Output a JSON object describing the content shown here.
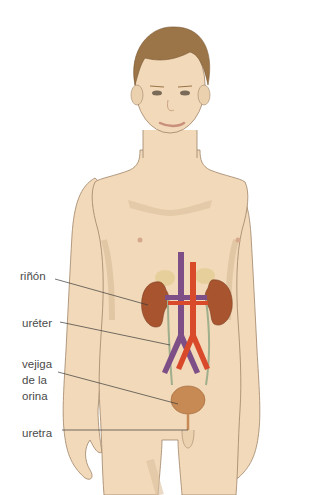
{
  "diagram": {
    "labels": {
      "kidney": "riñón",
      "ureter": "uréter",
      "bladder_line1": "vejiga",
      "bladder_line2": "de la",
      "bladder_line3": "orina",
      "urethra": "uretra"
    },
    "colors": {
      "skin": "#f1d9b9",
      "skin_shadow": "#dcbf9c",
      "outline": "#a08468",
      "hair": "#9b7447",
      "kidney": "#a8552f",
      "adrenal": "#e7cf9c",
      "vein": "#7e4f86",
      "artery": "#d94a2a",
      "ureter": "#9fae8c",
      "bladder": "#c88a55",
      "leader_line": "#3a3a3a",
      "label_text": "#4a4a4a"
    }
  }
}
